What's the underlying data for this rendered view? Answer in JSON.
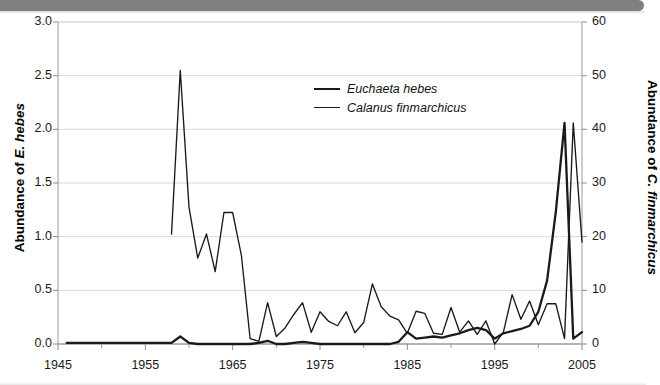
{
  "figure": {
    "background_color": "#ffffff",
    "banner_color": "#808080",
    "line_color": "#1a1a1a"
  },
  "axes": {
    "y_left_title_prefix": "Abundance of ",
    "y_left_title_species": "E. hebes",
    "y_right_title_prefix": "Abundance of ",
    "y_right_title_species": "C. finmarchicus",
    "y_left_ticks": [
      "0.0",
      "0.5",
      "1.0",
      "1.5",
      "2.0",
      "2.5",
      "3.0"
    ],
    "y_right_ticks": [
      "0",
      "10",
      "20",
      "30",
      "40",
      "50",
      "60"
    ],
    "x_ticks": [
      "1945",
      "1955",
      "1965",
      "1975",
      "1985",
      "1995",
      "2005"
    ]
  },
  "legend": {
    "items": [
      {
        "label": "Euchaeta hebes",
        "style": "thick"
      },
      {
        "label": "Calanus finmarchicus",
        "style": "thin"
      }
    ]
  },
  "chart_data": {
    "type": "line",
    "title": "",
    "xlabel": "",
    "ylabel": "Abundance of E. hebes",
    "y2label": "Abundance of C. finmarchicus",
    "xlim": [
      1945,
      2005
    ],
    "ylim": [
      0.0,
      3.0
    ],
    "y2lim": [
      0,
      60
    ],
    "grid": true,
    "legend_position": "upper-center",
    "x": [
      1946,
      1947,
      1948,
      1949,
      1950,
      1951,
      1952,
      1953,
      1954,
      1955,
      1956,
      1957,
      1958,
      1959,
      1960,
      1961,
      1962,
      1963,
      1964,
      1965,
      1966,
      1967,
      1968,
      1969,
      1970,
      1971,
      1972,
      1973,
      1974,
      1975,
      1976,
      1977,
      1978,
      1979,
      1980,
      1981,
      1982,
      1983,
      1984,
      1985,
      1986,
      1987,
      1988,
      1989,
      1990,
      1991,
      1992,
      1993,
      1994,
      1995,
      1996,
      1997,
      1998,
      1999,
      2000,
      2001,
      2002,
      2003,
      2004,
      2005
    ],
    "series": [
      {
        "name": "Euchaeta hebes",
        "axis": "left",
        "style": "thick",
        "units": "abundance",
        "values": [
          0.01,
          0.01,
          0.01,
          0.01,
          0.01,
          0.01,
          0.01,
          0.01,
          0.01,
          0.01,
          0.01,
          0.01,
          0.01,
          0.07,
          0.01,
          0.0,
          0.0,
          0.0,
          0.0,
          0.0,
          0.0,
          0.0,
          0.01,
          0.03,
          0.0,
          0.0,
          0.01,
          0.02,
          0.01,
          0.0,
          0.0,
          0.0,
          0.0,
          0.0,
          0.0,
          0.0,
          0.0,
          0.0,
          0.02,
          0.11,
          0.05,
          0.06,
          0.07,
          0.06,
          0.08,
          0.1,
          0.13,
          0.15,
          0.13,
          0.05,
          0.1,
          0.12,
          0.14,
          0.17,
          0.3,
          0.59,
          1.23,
          2.06,
          0.05,
          0.11
        ]
      },
      {
        "name": "Calanus finmarchicus",
        "axis": "right",
        "style": "thin",
        "units": "abundance",
        "values": [
          null,
          null,
          null,
          null,
          null,
          null,
          null,
          null,
          null,
          null,
          null,
          null,
          20.5,
          51.0,
          25.5,
          16.0,
          20.5,
          13.5,
          24.5,
          24.5,
          16.5,
          1.0,
          0.5,
          7.7,
          1.4,
          3.0,
          5.5,
          7.7,
          2.2,
          6.0,
          4.2,
          3.4,
          6.0,
          2.1,
          4.0,
          11.2,
          7.0,
          5.2,
          4.5,
          2.0,
          6.1,
          5.7,
          2.0,
          1.8,
          6.8,
          2.2,
          4.3,
          1.8,
          4.3,
          0.0,
          2.2,
          9.2,
          4.6,
          8.0,
          3.6,
          7.5,
          7.5,
          1.0,
          41.2,
          19.0
        ]
      }
    ]
  }
}
